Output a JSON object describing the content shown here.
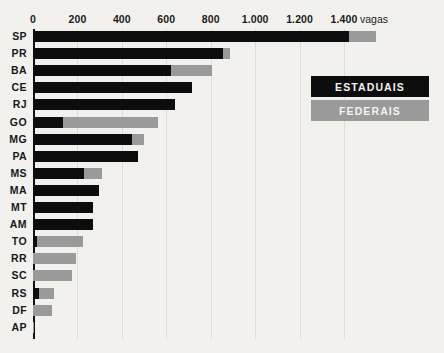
{
  "chart_data": {
    "type": "bar",
    "orientation": "horizontal",
    "stacked": true,
    "title": "",
    "subtitle": "",
    "xlabel": "vagas",
    "ylabel": "",
    "xlim": [
      0,
      1600
    ],
    "grid": true,
    "legend_position": "top-right",
    "axis_unit_label": "vagas",
    "xticks": [
      0,
      200,
      400,
      600,
      800,
      1000,
      1200,
      1400
    ],
    "xtick_labels": [
      "0",
      "200",
      "400",
      "600",
      "800",
      "1.000",
      "1.200",
      "1.400"
    ],
    "categories": [
      "SP",
      "PR",
      "BA",
      "CE",
      "RJ",
      "GO",
      "MG",
      "PA",
      "MS",
      "MA",
      "MT",
      "AM",
      "TO",
      "RR",
      "SC",
      "RS",
      "DF",
      "AP"
    ],
    "series": [
      {
        "name": "ESTADUAIS",
        "color": "#0d0d0d",
        "values": [
          1423,
          854,
          620,
          715,
          637,
          137,
          444,
          472,
          231,
          297,
          272,
          272,
          17,
          0,
          0,
          27,
          0,
          0
        ]
      },
      {
        "name": "FEDERAIS",
        "color": "#9a9a9a",
        "values": [
          121,
          33,
          185,
          0,
          0,
          428,
          57,
          0,
          81,
          0,
          0,
          0,
          210,
          192,
          174,
          69,
          87,
          5
        ]
      }
    ]
  },
  "legend": {
    "items": [
      {
        "label": "ESTADUAIS",
        "color": "#0d0d0d"
      },
      {
        "label": "FEDERAIS",
        "color": "#9a9a9a"
      }
    ]
  },
  "colors": {
    "background": "#f2f1ee",
    "estaduais": "#0d0d0d",
    "federais": "#9a9a9a",
    "axis": "#111111",
    "gridline": "#dedcd7",
    "text": "#1b1b1b"
  }
}
